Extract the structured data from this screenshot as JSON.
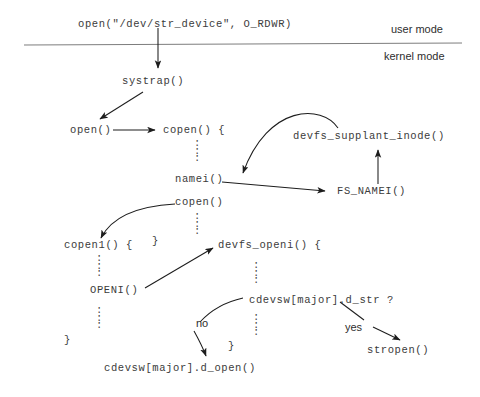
{
  "diagram": {
    "mode_labels": {
      "user": "user mode",
      "kernel": "kernel mode"
    },
    "nodes": {
      "syscall": "open(\"/dev/str_device\", O_RDWR)",
      "systrap": "systrap()",
      "open": "open()",
      "copen_open": "copen() {",
      "namei": "namei()",
      "copen_call": "copen()",
      "devfs_supplant_inode": "devfs_supplant_inode()",
      "fs_namei": "FS_NAMEI()",
      "copen1_open": "copen1() {",
      "copen_close": "}",
      "openi": "OPENI()",
      "copen1_close": "}",
      "devfs_openi_open": "devfs_openi() {",
      "cdevsw_cond": "cdevsw[major].d_str ?",
      "devfs_openi_close": "}",
      "stropen": "stropen()",
      "cdevsw_open": "cdevsw[major].d_open()"
    },
    "edge_labels": {
      "no": "no",
      "yes": "yes"
    },
    "ellipses": {
      "vertical": ":"
    },
    "colors": {
      "ink": "#3b3b3b",
      "label_ink": "#2e2e2e",
      "rule": "#7d7d7d",
      "background": "#ffffff"
    }
  }
}
